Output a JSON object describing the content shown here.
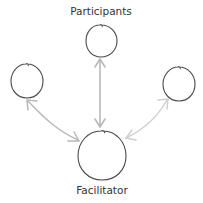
{
  "diagram": {
    "type": "hub-and-spoke",
    "labels": {
      "participants": "Participants",
      "facilitator": "Facilitator"
    },
    "nodes": [
      {
        "id": "participant-top",
        "group": "Participants",
        "cx": 101,
        "cy": 41,
        "rx": 16,
        "ry": 16
      },
      {
        "id": "participant-left",
        "group": "Participants",
        "cx": 27,
        "cy": 81,
        "rx": 16,
        "ry": 17
      },
      {
        "id": "participant-right",
        "group": "Participants",
        "cx": 179,
        "cy": 84,
        "rx": 16,
        "ry": 17
      },
      {
        "id": "facilitator",
        "group": "Facilitator",
        "cx": 102,
        "cy": 155,
        "rx": 24,
        "ry": 25
      }
    ],
    "edges": [
      {
        "from": "facilitator",
        "to": "participant-top",
        "direction": "bidirectional"
      },
      {
        "from": "facilitator",
        "to": "participant-left",
        "direction": "bidirectional"
      },
      {
        "from": "facilitator",
        "to": "participant-right",
        "direction": "bidirectional"
      }
    ],
    "colors": {
      "node_stroke": "#4a4a4a",
      "arrow_stroke": "#b8b8b8",
      "arrow_stroke_light": "#cfcfcf",
      "text": "#333333",
      "background": "#ffffff"
    }
  }
}
